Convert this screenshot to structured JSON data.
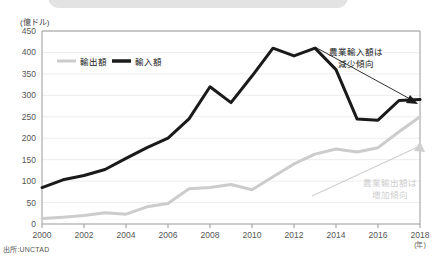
{
  "banner": {
    "present": true,
    "color": "#e3e3e3"
  },
  "axis_unit_label": "(億ドル)",
  "source_note": "出所:UNCTAD",
  "year_unit_label": "(年)",
  "annotations": {
    "import_trend_line1": "農業輸入額は",
    "import_trend_line2": "減少傾向",
    "export_trend_line1": "農業輸出額は",
    "export_trend_line2": "増加傾向"
  },
  "colors": {
    "import_line": "#1a1a1a",
    "export_line": "#cccccc",
    "grid": "#ededed",
    "axis": "#999999",
    "annotation_dark": "#1a1a1a",
    "annotation_light": "#cfcfcf"
  },
  "chart_data": {
    "type": "line",
    "title": "",
    "xlabel": "(年)",
    "ylabel": "(億ドル)",
    "ylim": [
      0,
      450
    ],
    "yticks": [
      0,
      50,
      100,
      150,
      200,
      250,
      300,
      350,
      400,
      450
    ],
    "grid": true,
    "legend_position": "top-left",
    "x": [
      2000,
      2001,
      2002,
      2003,
      2004,
      2005,
      2006,
      2007,
      2008,
      2009,
      2010,
      2011,
      2012,
      2013,
      2014,
      2015,
      2016,
      2017,
      2018
    ],
    "xticks": [
      2000,
      2002,
      2004,
      2006,
      2008,
      2010,
      2012,
      2014,
      2016,
      2018
    ],
    "series": [
      {
        "name": "輸出額",
        "color": "#cccccc",
        "values": [
          13,
          16,
          20,
          26,
          23,
          40,
          48,
          82,
          85,
          92,
          80,
          110,
          140,
          163,
          175,
          168,
          178,
          215,
          250
        ]
      },
      {
        "name": "輸入額",
        "color": "#1a1a1a",
        "values": [
          85,
          103,
          113,
          127,
          153,
          178,
          200,
          245,
          320,
          283,
          345,
          410,
          392,
          410,
          360,
          245,
          242,
          288,
          290
        ]
      }
    ]
  }
}
